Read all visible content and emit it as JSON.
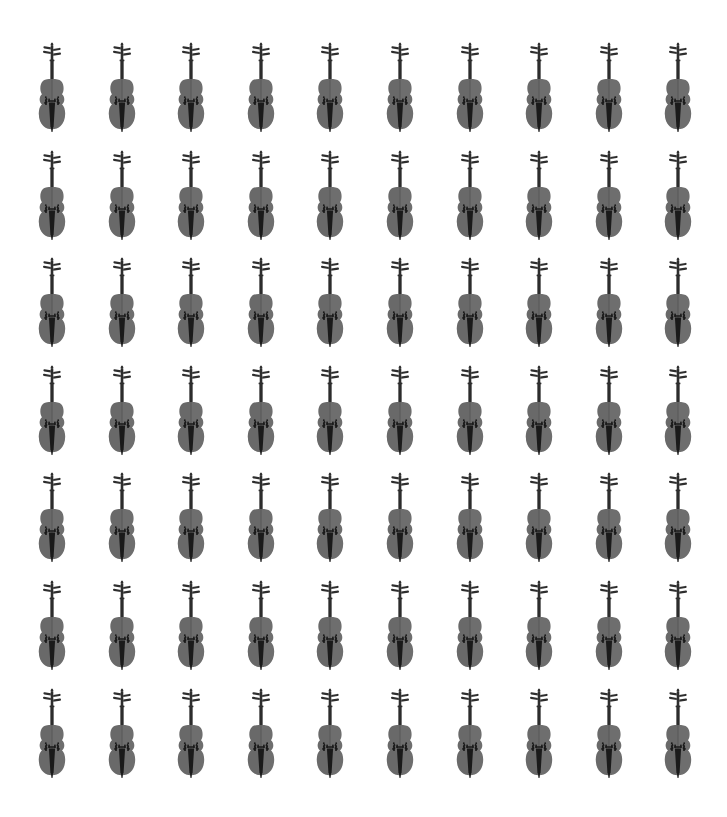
{
  "page": {
    "background_color": "#ffffff",
    "width": 727,
    "height": 817
  },
  "grid": {
    "rows": 7,
    "columns": 10,
    "total_icons": 70,
    "column_centers_x": [
      52,
      122,
      191,
      261,
      330,
      400,
      470,
      539,
      609,
      678
    ],
    "row_tops_y": [
      42,
      150,
      257,
      365,
      472,
      580,
      688
    ],
    "column_pitch": 69.6,
    "row_pitch": 107.5,
    "icon_width": 42,
    "icon_height": 102
  },
  "icon": {
    "name": "violin-icon",
    "semantic": "violin",
    "description": "Front-facing violin silhouette with scroll, pegbox, neck, body, f-holes, bridge and dark tailpiece",
    "body_color": "#6e6e6e",
    "body_shade_color": "#616161",
    "seam_color": "#585858",
    "dark_color": "#1a1a1a",
    "neck_color": "#3a3a3a",
    "scroll_color": "#2e2e2e"
  }
}
